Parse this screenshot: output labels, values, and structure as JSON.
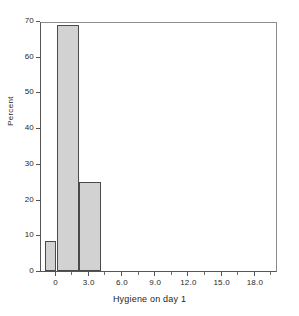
{
  "chart_data": {
    "type": "bar",
    "title": "",
    "xlabel": "Hygiene on day 1",
    "ylabel": "Percent",
    "xlim": [
      -1.4,
      20.0
    ],
    "ylim": [
      0,
      70
    ],
    "grid": false,
    "legend": null,
    "bin_width": 2,
    "bars": [
      {
        "label": "-1 to 0",
        "x_left": -1.0,
        "x_right": 0.0,
        "value": 8.3
      },
      {
        "label": "0 to 2",
        "x_left": 0.0,
        "x_right": 2.0,
        "value": 69.0
      },
      {
        "label": "2 to 4",
        "x_left": 2.0,
        "x_right": 4.0,
        "value": 25.0
      }
    ],
    "categories": [
      "-1 to 0",
      "0 to 2",
      "2 to 4"
    ],
    "values": [
      8.3,
      69.0,
      25.0
    ],
    "y_ticks": [
      {
        "value": 0,
        "label": "0"
      },
      {
        "value": 10,
        "label": "10"
      },
      {
        "value": 20,
        "label": "20"
      },
      {
        "value": 30,
        "label": "30"
      },
      {
        "value": 40,
        "label": "40"
      },
      {
        "value": 50,
        "label": "50"
      },
      {
        "value": 60,
        "label": "60"
      },
      {
        "value": 70,
        "label": "70"
      }
    ],
    "x_ticks": [
      {
        "value": 0,
        "label": "0"
      },
      {
        "value": 3,
        "label": "3.0"
      },
      {
        "value": 6,
        "label": "6.0"
      },
      {
        "value": 9,
        "label": "9.0"
      },
      {
        "value": 12,
        "label": "12.0"
      },
      {
        "value": 15,
        "label": "15.0"
      },
      {
        "value": 18,
        "label": "18.0"
      }
    ],
    "colors": {
      "bar_fill": "#d2d2d2",
      "bar_edge": "#4a4a4a",
      "axis": "#555555",
      "text": "#1f1f1f",
      "background": "#ffffff"
    }
  }
}
